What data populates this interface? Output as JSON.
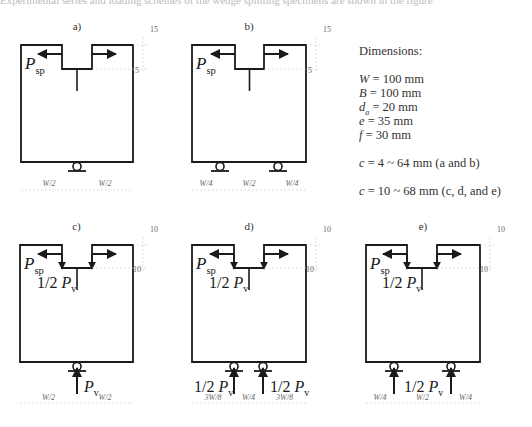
{
  "caption_clipped": "Experimental series and loading schemes of the wedge splitting specimens are shown in the figure",
  "dimensions": {
    "title": "Dimensions:",
    "items": [
      {
        "sym": "W",
        "sub": "",
        "val": " = 100 mm"
      },
      {
        "sym": "B",
        "sub": "",
        "val": " = 100 mm"
      },
      {
        "sym": "d",
        "sub": "a",
        "val": " = 20 mm"
      },
      {
        "sym": "e",
        "sub": "",
        "val": " = 35 mm"
      },
      {
        "sym": "f",
        "sub": "",
        "val": " = 30 mm"
      }
    ],
    "notes": [
      {
        "sym": "c",
        "val": " = 4 ~ 64 mm (a and b)"
      },
      {
        "sym": "c",
        "val": " = 10 ~ 68 mm (c, d, and e)"
      }
    ]
  },
  "panels": [
    {
      "label": "a)",
      "x": 21,
      "y": 45,
      "w": 112,
      "h": 117,
      "notch": {
        "x1": 62,
        "x2": 92,
        "depth": 24
      },
      "vertical_load": false,
      "right_ticks": [
        "15",
        "5"
      ],
      "supports": [
        77
      ],
      "support_arrows": [],
      "support_labels": [],
      "span_labels": [
        "W/2",
        "W/2"
      ],
      "span_breaks": [
        77
      ]
    },
    {
      "label": "b)",
      "x": 192,
      "y": 45,
      "w": 114,
      "h": 117,
      "notch": {
        "x1": 235,
        "x2": 264,
        "depth": 24
      },
      "vertical_load": false,
      "right_ticks": [
        "15",
        "5"
      ],
      "supports": [
        220,
        278
      ],
      "support_arrows": [],
      "support_labels": [],
      "span_labels": [
        "W/4",
        "W/2",
        "W/4"
      ],
      "span_breaks": [
        220,
        278
      ]
    },
    {
      "label": "c)",
      "x": 20,
      "y": 245,
      "w": 113,
      "h": 117,
      "notch": {
        "x1": 62,
        "x2": 92,
        "depth": 23
      },
      "vertical_load": true,
      "right_ticks": [
        "10",
        "10"
      ],
      "supports": [
        77
      ],
      "support_arrows": [
        77
      ],
      "support_labels": [
        {
          "text": "P",
          "sub": "v",
          "x": 84,
          "y": 392
        }
      ],
      "span_labels": [
        "W/2",
        "W/2"
      ],
      "span_breaks": [
        77
      ]
    },
    {
      "label": "d)",
      "x": 192,
      "y": 245,
      "w": 114,
      "h": 117,
      "notch": {
        "x1": 234,
        "x2": 264,
        "depth": 23
      },
      "vertical_load": true,
      "right_ticks": [
        "10",
        "10"
      ],
      "supports": [
        234,
        263
      ],
      "support_arrows": [
        234,
        263
      ],
      "support_labels": [
        {
          "text": "1/2 P",
          "sub": "v",
          "x": 194,
          "y": 392
        },
        {
          "text": "1/2 P",
          "sub": "v",
          "x": 270,
          "y": 392
        }
      ],
      "span_labels": [
        "3W/8",
        "W/4",
        "3W/8"
      ],
      "span_breaks": [
        234,
        263
      ]
    },
    {
      "label": "e)",
      "x": 366,
      "y": 245,
      "w": 114,
      "h": 117,
      "notch": {
        "x1": 407,
        "x2": 437,
        "depth": 23
      },
      "vertical_load": true,
      "right_ticks": [
        "10",
        "10"
      ],
      "supports": [
        394,
        451
      ],
      "support_arrows": [
        394,
        451
      ],
      "support_labels": [
        {
          "text": "1/2 P",
          "sub": "v",
          "x": 404,
          "y": 392
        }
      ],
      "span_labels": [
        "W/4",
        "W/2",
        "W/4"
      ],
      "span_breaks": [
        394,
        451
      ]
    }
  ],
  "labels": {
    "splitting_force": {
      "text": "P",
      "sub": "sp"
    },
    "half_vertical": {
      "text": "1/2 P",
      "sub": "v"
    }
  },
  "colors": {
    "line": "#1a1a1a",
    "dim": "#c8c8c8",
    "dimtext": "#666666"
  }
}
